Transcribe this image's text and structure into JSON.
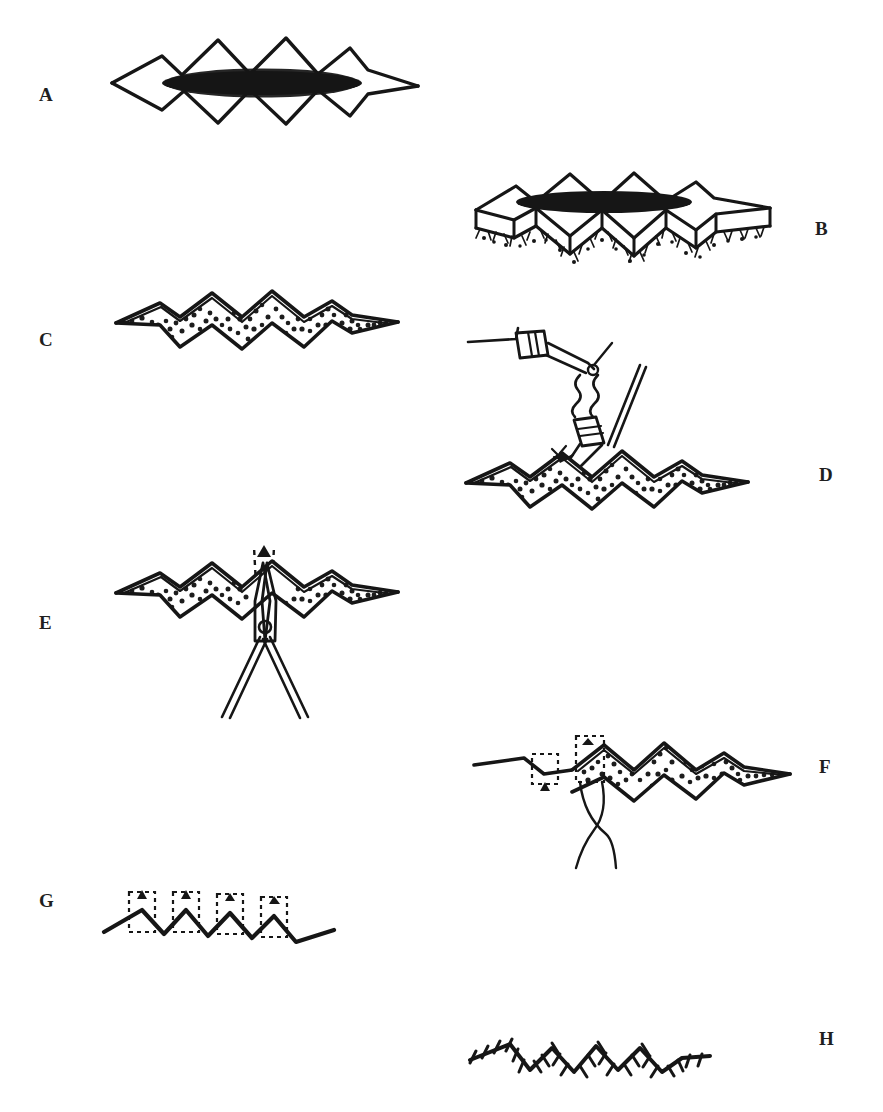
{
  "figure": {
    "background_color": "#ffffff",
    "ink_color": "#161616",
    "panel_count": 8
  },
  "panels": [
    {
      "id": "A",
      "label": "A",
      "label_x": 46,
      "label_y": 97,
      "caption": "W-plasty incision outlined around the lesion",
      "elements": [
        "zigzag-outline",
        "lesion-ellipse"
      ],
      "lesion_color": "#1d1d1d"
    },
    {
      "id": "B",
      "label": "B",
      "label_x": 822,
      "label_y": 231,
      "caption": "Three-dimensional view of full-thickness excision with lesion in place",
      "elements": [
        "zigzag-outline-3d",
        "lesion-ellipse",
        "undersurface-hatching"
      ]
    },
    {
      "id": "C",
      "label": "C",
      "label_x": 46,
      "label_y": 342,
      "caption": "Open W-shaped defect with exposed subcutaneous fat",
      "elements": [
        "zigzag-defect",
        "stippled-fat"
      ]
    },
    {
      "id": "D",
      "label": "D",
      "label_x": 826,
      "label_y": 477,
      "caption": "Hemostasis of the wound bed with electrocautery",
      "elements": [
        "zigzag-defect",
        "stippled-fat",
        "electrocautery-handpiece",
        "cautery-cord"
      ]
    },
    {
      "id": "E",
      "label": "E",
      "label_x": 46,
      "label_y": 625,
      "caption": "Undermining the wound edges with scissors",
      "elements": [
        "zigzag-defect",
        "stippled-fat",
        "scissors",
        "motion-arrow-dashed"
      ]
    },
    {
      "id": "F",
      "label": "F",
      "label_x": 826,
      "label_y": 769,
      "caption": "Buried dermal sutures approximate the interdigitating triangles",
      "elements": [
        "partially-closed-zigzag",
        "stippled-fat",
        "dashed-suture-boxes",
        "suture-thread"
      ]
    },
    {
      "id": "G",
      "label": "G",
      "label_x": 46,
      "label_y": 903,
      "caption": "Completed deep closure with apical sutures marked",
      "elements": [
        "closed-zigzag-line",
        "dashed-suture-boxes"
      ]
    },
    {
      "id": "H",
      "label": "H",
      "label_x": 826,
      "label_y": 1041,
      "caption": "Final skin closure with interrupted cutaneous sutures",
      "elements": [
        "closed-zigzag-line",
        "suture-tick-marks"
      ]
    }
  ]
}
